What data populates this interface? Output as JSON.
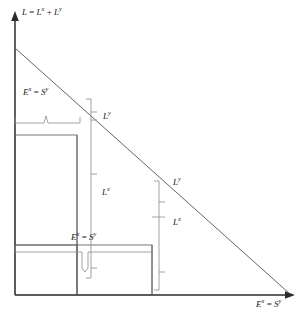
{
  "figure": {
    "type": "economics-diagram",
    "background_color": "#ffffff",
    "line_color": "#3a3a3a",
    "axis_color": "#2b2b2b",
    "text_color": "#1a1a1a",
    "width": 307,
    "height": 318
  },
  "axes": {
    "y_axis": {
      "name": "vertical-axis",
      "label_plain": "L = L^x + L^y",
      "label_main": "L",
      "label_eq": " = ",
      "label_term1": "L",
      "label_term1_sup": "x",
      "label_plus": " + ",
      "label_term2": "L",
      "label_term2_sup": "y",
      "x_px": 15,
      "top_px": 18,
      "bottom_px": 295
    },
    "x_axis": {
      "name": "horizontal-axis",
      "label_plain": "E^x = S^y",
      "label_term1": "E",
      "label_term1_sup": "x",
      "label_eq": " = ",
      "label_term2": "S",
      "label_term2_sup": "y",
      "y_px": 295,
      "left_px": 15,
      "right_px": 292
    }
  },
  "diagonal": {
    "name": "budget-frontier-line",
    "x1": 15,
    "y1": 48,
    "x2": 290,
    "y2": 294
  },
  "annotations": [
    {
      "id": "ex-sy-top",
      "plain": "E^x = S^y",
      "term1": "E",
      "term1_sup": "x",
      "eq": " = ",
      "term2": "S",
      "term2_sup": "y",
      "x": 23,
      "y": 91
    },
    {
      "id": "ly-upper",
      "plain": "L^y",
      "term1": "L",
      "term1_sup": "y",
      "x": 103,
      "y": 117
    },
    {
      "id": "lx-middle",
      "plain": "L^x",
      "term1": "L",
      "term1_sup": "x",
      "x": 102,
      "y": 192
    },
    {
      "id": "ly-right",
      "plain": "L^y",
      "term1": "L",
      "term1_sup": "y",
      "x": 173,
      "y": 182
    },
    {
      "id": "lx-right",
      "plain": "L^x",
      "term1": "L",
      "term1_sup": "x",
      "x": 173,
      "y": 222
    },
    {
      "id": "ex-sy-bottom",
      "plain": "E^x = S^y",
      "term1": "E",
      "term1_sup": "x",
      "eq": " = ",
      "term2": "S",
      "term2_sup": "y",
      "x": 71,
      "y": 236
    },
    {
      "id": "x-axis-title",
      "plain": "E^x = S^y",
      "term1": "E",
      "term1_sup": "x",
      "eq": " = ",
      "term2": "S",
      "term2_sup": "y",
      "x": 258,
      "y": 300
    },
    {
      "id": "y-axis-title",
      "plain": "L = L^x + L^y",
      "x": 22,
      "y": 9
    }
  ],
  "rectangles": [
    {
      "name": "upper-left-block",
      "x": 15,
      "y": 135,
      "width": 62,
      "height": 110
    },
    {
      "name": "lower-left-block",
      "x": 15,
      "y": 245,
      "width": 62,
      "height": 50
    },
    {
      "name": "center-block",
      "x": 77,
      "y": 245,
      "width": 75,
      "height": 50
    }
  ],
  "braces": {
    "top_horizontal": {
      "name": "top-horizontal-brace",
      "x_start": 15,
      "x_end": 80,
      "y": 123,
      "tick_x": 46
    },
    "bottom_horizontal": {
      "name": "bottom-horizontal-brace",
      "x_start": 15,
      "x_end": 152,
      "y": 252,
      "tick_x": 85
    },
    "left_vertical": {
      "name": "left-vertical-brace",
      "x": 91,
      "y_start": 99,
      "y_end": 278,
      "tick1_y": 117,
      "tick2_y": 174,
      "tick3_y": 268
    },
    "right_vertical": {
      "name": "right-vertical-brace",
      "x": 159,
      "y_start": 181,
      "y_end": 290,
      "tick1_y": 202,
      "tick2_y": 217,
      "tick3_y": 272
    }
  }
}
